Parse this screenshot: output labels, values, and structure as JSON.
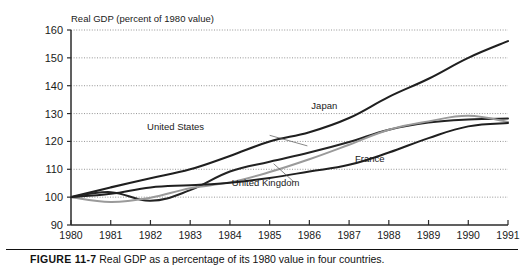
{
  "figure": {
    "label": "FIGURE 11-7",
    "caption_text": "Real GDP as a percentage of its 1980 value in four countries."
  },
  "chart_data": {
    "type": "line",
    "title": "Real GDP (percent of 1980 value)",
    "xlabel": "",
    "ylabel": "Real GDP (percent of 1980 value)",
    "xlim": [
      1980,
      1991
    ],
    "ylim": [
      90,
      160
    ],
    "yticks": [
      90,
      100,
      110,
      120,
      130,
      140,
      150,
      160
    ],
    "ytick_labels": [
      "90",
      "100",
      "110",
      "120",
      "130",
      "140",
      "150",
      "160"
    ],
    "grid": true,
    "grid_style": "dotted-horizontal",
    "legend": "inline-labels",
    "x": [
      1980,
      1981,
      1982,
      1983,
      1984,
      1985,
      1986,
      1987,
      1988,
      1989,
      1990,
      1991
    ],
    "xtick_labels": [
      "1980",
      "1981",
      "1982",
      "1983",
      "1984",
      "1985",
      "1986",
      "1987",
      "1988",
      "1989",
      "1990",
      "1991"
    ],
    "series": [
      {
        "name": "Japan",
        "color": "#1f1f1f",
        "width": 2.1,
        "label_x": 1986.05,
        "label_y": 131.5,
        "leader": null,
        "values": [
          100,
          103.5,
          106.8,
          110.0,
          114.8,
          120.0,
          123.3,
          128.4,
          136.0,
          142.5,
          150.0,
          156.0
        ]
      },
      {
        "name": "United States",
        "color": "#232323",
        "width": 2.0,
        "label_x": 1983.35,
        "label_y": 124.2,
        "leader": {
          "x1": 1985.0,
          "y1": 122.2,
          "x2": 1985.95,
          "y2": 118.4
        },
        "values": [
          100,
          101.8,
          98.7,
          102.5,
          109.2,
          112.7,
          116.0,
          119.8,
          124.2,
          126.8,
          127.9,
          128.2
        ]
      },
      {
        "name": "United Kingdom",
        "color": "#9a9a9a",
        "width": 2.0,
        "label_x": 1985.75,
        "label_y": 104.0,
        "leader": {
          "x1": 1985.6,
          "y1": 105.6,
          "x2": 1985.1,
          "y2": 112.0
        },
        "values": [
          100,
          98.3,
          99.8,
          103.2,
          105.3,
          109.0,
          113.6,
          118.8,
          124.2,
          127.2,
          129.2,
          127.0
        ]
      },
      {
        "name": "France",
        "color": "#1f1f1f",
        "width": 2.0,
        "label_x": 1987.15,
        "label_y": 112.6,
        "leader": null,
        "values": [
          100,
          101.2,
          103.5,
          104.3,
          105.2,
          106.9,
          109.2,
          111.6,
          116.0,
          121.2,
          125.4,
          126.6
        ]
      }
    ]
  }
}
